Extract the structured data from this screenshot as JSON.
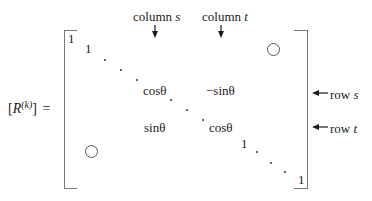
{
  "lhs": {
    "open_bracket": "[",
    "symbol": "R",
    "superscript": "(k)",
    "close_bracket": "]",
    "equals": "="
  },
  "column_labels": [
    {
      "word": "column",
      "var": "s"
    },
    {
      "word": "column",
      "var": "t"
    }
  ],
  "row_labels": [
    {
      "word": "row",
      "var": "s"
    },
    {
      "word": "row",
      "var": "t"
    }
  ],
  "entries": {
    "diag_top_first": "1",
    "diag_top_second": "1",
    "ss": "cosθ",
    "st": "−sinθ",
    "ts": "sinθ",
    "tt": "cosθ",
    "diag_after_t": "1",
    "diag_last": "1"
  },
  "zero_blocks": [
    "upper-right zero block",
    "lower-left zero block"
  ],
  "colors": {
    "text": "#1a1a1a",
    "bracket": "#777777",
    "circle": "#555555"
  }
}
